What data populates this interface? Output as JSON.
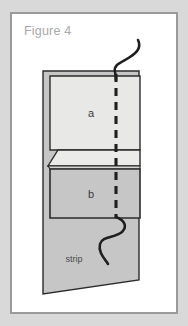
{
  "figure": {
    "title": "Figure 4",
    "card_background": "#ffffff",
    "page_background": "#d9d9d9",
    "border_color": "#9a9a9a"
  },
  "diagram": {
    "type": "bookbinding-sewing-diagram",
    "labels": {
      "sheet_a": "a",
      "sheet_b": "b",
      "strip": "strip"
    },
    "colors": {
      "strip_fill": "#c6c6c6",
      "sheet_a_fill": "#e8e8e6",
      "sheet_b_fill": "#c6c6c6",
      "flap_fill": "#ebebe9",
      "outline": "#2b2b2b",
      "thread": "#1f1f1f",
      "dashed_line": "#1f1f1f"
    },
    "elements": [
      {
        "name": "strip",
        "kind": "sheet",
        "label": "strip"
      },
      {
        "name": "sheet-a",
        "kind": "sheet",
        "label": "a"
      },
      {
        "name": "fold-flap",
        "kind": "flap",
        "label": ""
      },
      {
        "name": "sheet-b",
        "kind": "sheet",
        "label": "b"
      },
      {
        "name": "stitch-line",
        "kind": "dashed-line",
        "label": ""
      },
      {
        "name": "thread-top",
        "kind": "thread",
        "label": ""
      },
      {
        "name": "thread-bottom",
        "kind": "thread",
        "label": ""
      }
    ]
  }
}
